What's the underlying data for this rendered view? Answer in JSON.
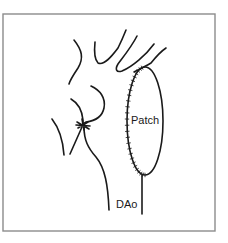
{
  "diagram": {
    "labels": {
      "patch": "Patch",
      "descending_aorta": "DAo"
    },
    "colors": {
      "line": "#1a1a1a",
      "border": "#8c8c8c",
      "background": "#ffffff"
    }
  }
}
